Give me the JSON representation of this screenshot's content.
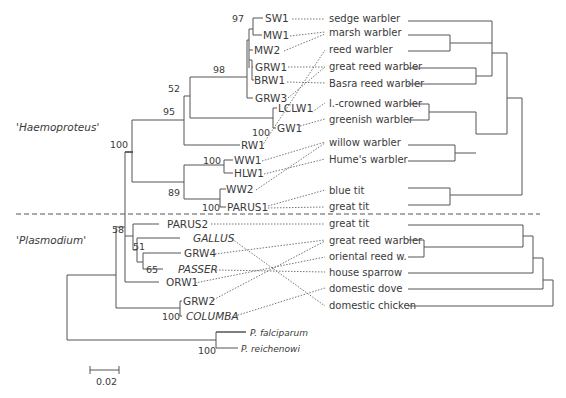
{
  "groups": {
    "haemoproteus": "'Haemoproteus'",
    "plasmodium": "'Plasmodium'"
  },
  "parasites": [
    {
      "id": "SW1",
      "label": "SW1",
      "italic": false
    },
    {
      "id": "MW1",
      "label": "MW1",
      "italic": false
    },
    {
      "id": "MW2",
      "label": "MW2",
      "italic": false
    },
    {
      "id": "GRW1",
      "label": "GRW1",
      "italic": false
    },
    {
      "id": "BRW1",
      "label": "BRW1",
      "italic": false
    },
    {
      "id": "GRW3",
      "label": "GRW3",
      "italic": false
    },
    {
      "id": "LCLW1",
      "label": "LCLW1",
      "italic": false
    },
    {
      "id": "GW1",
      "label": "GW1",
      "italic": false
    },
    {
      "id": "RW1",
      "label": "RW1",
      "italic": false
    },
    {
      "id": "WW1",
      "label": "WW1",
      "italic": false
    },
    {
      "id": "HLW1",
      "label": "HLW1",
      "italic": false
    },
    {
      "id": "WW2",
      "label": "WW2",
      "italic": false
    },
    {
      "id": "PARUS1",
      "label": "PARUS1",
      "italic": false
    },
    {
      "id": "PARUS2",
      "label": "PARUS2",
      "italic": false
    },
    {
      "id": "GALLUS",
      "label": "GALLUS",
      "italic": true
    },
    {
      "id": "GRW4",
      "label": "GRW4",
      "italic": false
    },
    {
      "id": "PASSER",
      "label": "PASSER",
      "italic": true
    },
    {
      "id": "ORW1",
      "label": "ORW1",
      "italic": false
    },
    {
      "id": "GRW2",
      "label": "GRW2",
      "italic": false
    },
    {
      "id": "COLUMBA",
      "label": "COLUMBA",
      "italic": true
    },
    {
      "id": "PFAL",
      "label": "P. falciparum",
      "italic": true
    },
    {
      "id": "PREI",
      "label": "P. reichenowi",
      "italic": true
    }
  ],
  "bootstrap": {
    "b97": "97",
    "b98": "98",
    "b52": "52",
    "b95": "95",
    "b100_gw": "100",
    "b100_root": "100",
    "b100_ww": "100",
    "b89": "89",
    "b100_parus": "100",
    "b58": "58",
    "b51": "51",
    "b65": "65",
    "b100_columba": "100",
    "b100_pf": "100"
  },
  "hosts": [
    "sedge warbler",
    "marsh warbler",
    "reed warbler",
    "great reed warbler",
    "Basra reed warbler",
    "l.-crowned warbler",
    "greenish warbler",
    "willow warbler",
    "Hume's warbler",
    "blue tit",
    "great tit",
    "great tit",
    "great reed warbler",
    "oriental reed w.",
    "house sparrow",
    "domestic dove",
    "domestic chicken"
  ],
  "associations": [
    [
      "SW1",
      "sedge warbler"
    ],
    [
      "MW1",
      "marsh warbler"
    ],
    [
      "MW2",
      "marsh warbler"
    ],
    [
      "GRW1",
      "great reed warbler"
    ],
    [
      "BRW1",
      "Basra reed warbler"
    ],
    [
      "GRW3",
      "great reed warbler"
    ],
    [
      "LCLW1",
      "l.-crowned warbler"
    ],
    [
      "GW1",
      "greenish warbler"
    ],
    [
      "RW1",
      "reed warbler"
    ],
    [
      "WW1",
      "willow warbler"
    ],
    [
      "HLW1",
      "Hume's warbler"
    ],
    [
      "WW2",
      "willow warbler"
    ],
    [
      "PARUS1",
      "blue tit"
    ],
    [
      "PARUS1",
      "great tit"
    ],
    [
      "PARUS2",
      "great tit"
    ],
    [
      "GALLUS",
      "domestic chicken"
    ],
    [
      "GRW4",
      "great reed warbler"
    ],
    [
      "PASSER",
      "house sparrow"
    ],
    [
      "ORW1",
      "oriental reed w."
    ],
    [
      "GRW2",
      "great reed warbler"
    ],
    [
      "COLUMBA",
      "domestic dove"
    ]
  ],
  "scale_bar": {
    "label": "0.02"
  }
}
